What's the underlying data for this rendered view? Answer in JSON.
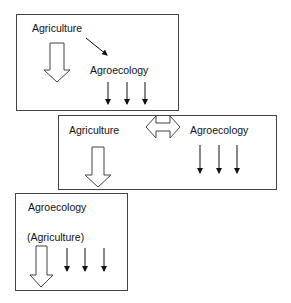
{
  "boxes": [
    {
      "labels": {
        "top": "Agriculture",
        "bottom": "Agroecology"
      }
    },
    {
      "labels": {
        "left": "Agriculture",
        "right": "Agroecology"
      }
    },
    {
      "labels": {
        "top": "Agroecology",
        "bottom": "(Agriculture)"
      }
    }
  ]
}
